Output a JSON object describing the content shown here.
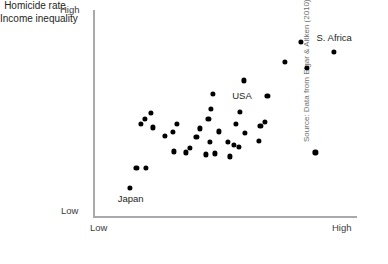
{
  "chart_data": {
    "type": "scatter",
    "title": "",
    "xlabel": "Income inequality",
    "ylabel": "Homicide rate",
    "xtick_labels": [
      "Low",
      "High"
    ],
    "ytick_labels": [
      "Low",
      "High"
    ],
    "xlim": [
      0,
      100
    ],
    "ylim": [
      0,
      100
    ],
    "grid": false,
    "legend": null,
    "source_note": "Source: Data from Elgar & Aitken (2010).",
    "annotations": [
      {
        "label": "S. Africa",
        "x": 92.0,
        "y": 81.2
      },
      {
        "label": "USA",
        "x": 47.3,
        "y": 54.8
      },
      {
        "label": "Japan",
        "x": 13.3,
        "y": 13.0
      }
    ],
    "points": [
      {
        "x": 92.0,
        "y": 81.2,
        "label": "S. Africa"
      },
      {
        "x": 79.2,
        "y": 86.1,
        "label": ""
      },
      {
        "x": 73.1,
        "y": 76.0,
        "label": ""
      },
      {
        "x": 81.4,
        "y": 73.1,
        "label": ""
      },
      {
        "x": 57.2,
        "y": 66.8,
        "label": ""
      },
      {
        "x": 45.5,
        "y": 60.1,
        "label": ""
      },
      {
        "x": 44.7,
        "y": 52.4,
        "label": ""
      },
      {
        "x": 55.7,
        "y": 51.0,
        "label": ""
      },
      {
        "x": 54.2,
        "y": 45.2,
        "label": ""
      },
      {
        "x": 66.3,
        "y": 59.1,
        "label": ""
      },
      {
        "x": 63.6,
        "y": 44.2,
        "label": ""
      },
      {
        "x": 84.8,
        "y": 30.8,
        "label": ""
      },
      {
        "x": 19.3,
        "y": 47.6,
        "label": ""
      },
      {
        "x": 17.8,
        "y": 45.2,
        "label": ""
      },
      {
        "x": 21.6,
        "y": 50.5,
        "label": ""
      },
      {
        "x": 22.3,
        "y": 43.3,
        "label": ""
      },
      {
        "x": 26.9,
        "y": 38.9,
        "label": ""
      },
      {
        "x": 31.4,
        "y": 45.2,
        "label": ""
      },
      {
        "x": 29.9,
        "y": 40.9,
        "label": ""
      },
      {
        "x": 36.4,
        "y": 33.2,
        "label": ""
      },
      {
        "x": 40.5,
        "y": 42.8,
        "label": ""
      },
      {
        "x": 43.6,
        "y": 47.6,
        "label": ""
      },
      {
        "x": 39.0,
        "y": 38.5,
        "label": ""
      },
      {
        "x": 44.3,
        "y": 36.1,
        "label": ""
      },
      {
        "x": 47.7,
        "y": 41.3,
        "label": ""
      },
      {
        "x": 46.2,
        "y": 30.3,
        "label": ""
      },
      {
        "x": 51.1,
        "y": 36.1,
        "label": ""
      },
      {
        "x": 53.4,
        "y": 34.6,
        "label": ""
      },
      {
        "x": 55.3,
        "y": 33.7,
        "label": ""
      },
      {
        "x": 57.6,
        "y": 40.4,
        "label": ""
      },
      {
        "x": 62.9,
        "y": 36.6,
        "label": ""
      },
      {
        "x": 65.5,
        "y": 46.2,
        "label": ""
      },
      {
        "x": 30.3,
        "y": 31.3,
        "label": ""
      },
      {
        "x": 34.9,
        "y": 30.8,
        "label": ""
      },
      {
        "x": 42.8,
        "y": 29.8,
        "label": ""
      },
      {
        "x": 51.9,
        "y": 28.8,
        "label": ""
      },
      {
        "x": 15.9,
        "y": 23.1,
        "label": ""
      },
      {
        "x": 19.7,
        "y": 23.1,
        "label": ""
      },
      {
        "x": 13.3,
        "y": 13.0,
        "label": "Japan"
      }
    ]
  }
}
